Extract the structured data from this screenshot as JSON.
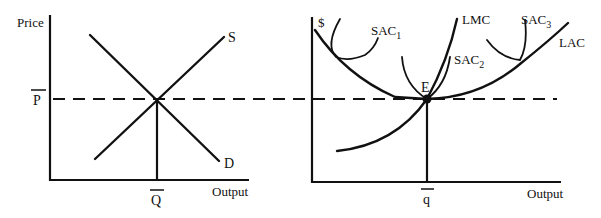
{
  "figure": {
    "left_panel": {
      "y_axis_label": "Price",
      "x_axis_label": "Output",
      "price_label": "P",
      "quantity_label": "Q",
      "supply_label": "S",
      "demand_label": "D"
    },
    "right_panel": {
      "y_axis_label": "$",
      "x_axis_label": "Output",
      "quantity_label": "q",
      "equilibrium_label": "E",
      "lmc_label": "LMC",
      "lac_label": "LAC",
      "sac1_label": "SAC",
      "sac1_sub": "1",
      "sac2_label": "SAC",
      "sac2_sub": "2",
      "sac3_label": "SAC",
      "sac3_sub": "3"
    },
    "line_color": "#111111",
    "background": "#ffffff"
  }
}
